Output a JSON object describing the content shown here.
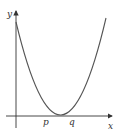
{
  "diagram": {
    "type": "parabola-graph",
    "axes": {
      "x_label": "x",
      "y_label": "y",
      "color": "#333333"
    },
    "curve": {
      "shape": "upward parabola",
      "color": "#555555"
    },
    "roots": [
      {
        "label": "p"
      },
      {
        "label": "q"
      }
    ]
  }
}
